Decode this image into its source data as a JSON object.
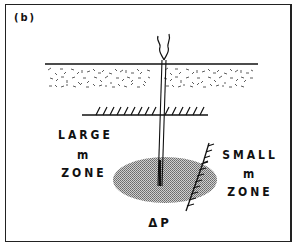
{
  "figure": {
    "panel_label": "(b)",
    "labels": {
      "large_zone": [
        "LARGE",
        "m",
        "ZONE"
      ],
      "small_zone": [
        "SMALL",
        "m",
        "ZONE"
      ],
      "pressure": "ΔP"
    },
    "elements": [
      "surface-line",
      "stippled-overburden-layer",
      "hatched-horizontal-boundary",
      "vertical-well",
      "wellhead-plume",
      "shaded-pressure-zone",
      "hatched-fault-boundary"
    ],
    "colors": {
      "ink": "#111111",
      "shade": "#9a9a9a",
      "background": "#ffffff"
    }
  }
}
